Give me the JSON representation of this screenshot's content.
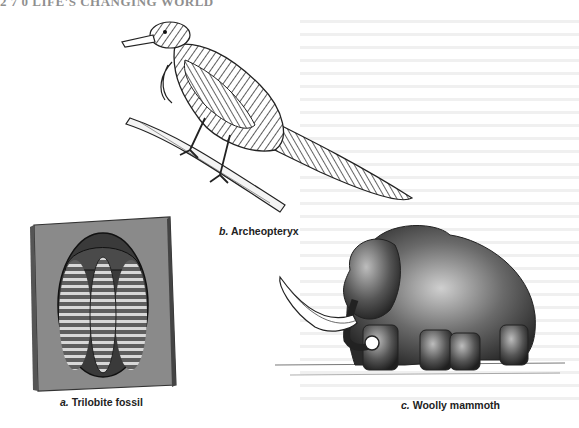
{
  "page": {
    "header": "2 7 0   LIFE'S CHANGING WORLD"
  },
  "figures": [
    {
      "id": "a",
      "letter": "a.",
      "label": "Trilobite fossil"
    },
    {
      "id": "b",
      "letter": "b.",
      "label": "Archeopteryx"
    },
    {
      "id": "c",
      "letter": "c.",
      "label": "Woolly mammoth"
    }
  ]
}
